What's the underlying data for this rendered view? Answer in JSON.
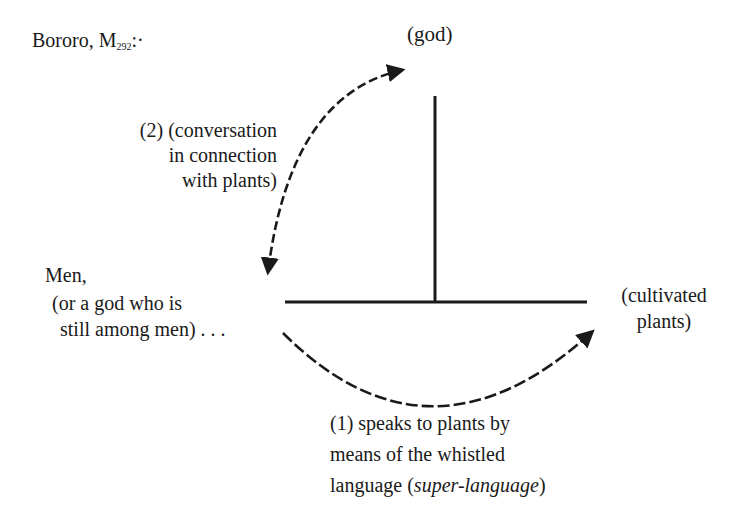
{
  "title": {
    "prefix": "Bororo, M",
    "subscript": "292",
    "suffix": ":·"
  },
  "nodes": {
    "top": "(god)",
    "left_main": "Men,",
    "left_sub_line1": "(or a god who is",
    "left_sub_line2": "still among men) . . .",
    "right_line1": "(cultivated",
    "right_line2": "plants)"
  },
  "arrows": {
    "upper": {
      "label_line1": "(2) (conversation",
      "label_line2": "in connection",
      "label_line3": "with plants)",
      "style": "dashed",
      "direction": "bidirectional"
    },
    "lower": {
      "label_line1": "(1) speaks to plants by",
      "label_line2": "means of the whistled",
      "label_line3_plain": "language (",
      "label_line3_italic": "super-language",
      "label_line3_close": ")",
      "style": "dashed",
      "direction": "left-to-right"
    }
  },
  "colors": {
    "ink": "#1a1a1a",
    "background": "#ffffff"
  }
}
